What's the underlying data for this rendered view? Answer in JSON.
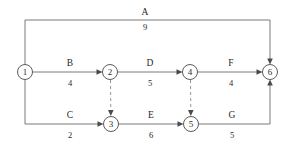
{
  "diagram": {
    "colors": {
      "background": "#ffffff",
      "line": "#6b6b6b",
      "dashed_line": "#8a8a8a",
      "node_stroke": "#4a4a4a",
      "text": "#1f1f1f"
    },
    "nodes": [
      {
        "id": "1",
        "label": "1",
        "cx": 25,
        "cy": 72,
        "r": 7.5
      },
      {
        "id": "2",
        "label": "2",
        "cx": 110,
        "cy": 72,
        "r": 7.5
      },
      {
        "id": "3",
        "label": "3",
        "cx": 111,
        "cy": 124,
        "r": 7.5
      },
      {
        "id": "4",
        "label": "4",
        "cx": 190,
        "cy": 72,
        "r": 7.5
      },
      {
        "id": "5",
        "label": "5",
        "cx": 191,
        "cy": 124,
        "r": 7.5
      },
      {
        "id": "6",
        "label": "6",
        "cx": 270,
        "cy": 72,
        "r": 7.5
      }
    ],
    "activities": [
      {
        "name": "A",
        "duration": "9",
        "from": "1",
        "to": "6",
        "style": "solid",
        "label_x": 145,
        "name_y": 12,
        "dur_y": 27
      },
      {
        "name": "B",
        "duration": "4",
        "from": "1",
        "to": "2",
        "style": "solid",
        "label_x": 70,
        "name_y": 65,
        "dur_y": 84
      },
      {
        "name": "C",
        "duration": "2",
        "from": "1",
        "to": "3",
        "style": "solid",
        "label_x": 70,
        "name_y": 117,
        "dur_y": 136
      },
      {
        "name": "D",
        "duration": "5",
        "from": "2",
        "to": "4",
        "style": "solid",
        "label_x": 150,
        "name_y": 65,
        "dur_y": 84
      },
      {
        "name": "E",
        "duration": "6",
        "from": "3",
        "to": "5",
        "style": "solid",
        "label_x": 151,
        "name_y": 117,
        "dur_y": 136
      },
      {
        "name": "F",
        "duration": "4",
        "from": "4",
        "to": "6",
        "style": "solid",
        "label_x": 230,
        "name_y": 65,
        "dur_y": 84
      },
      {
        "name": "G",
        "duration": "5",
        "from": "5",
        "to": "6",
        "style": "solid",
        "label_x": 231,
        "name_y": 117,
        "dur_y": 136
      }
    ],
    "dummy_activities": [
      {
        "from": "2",
        "to": "3",
        "style": "dashed",
        "duration": "0"
      },
      {
        "from": "4",
        "to": "5",
        "style": "dashed",
        "duration": "0"
      }
    ]
  }
}
